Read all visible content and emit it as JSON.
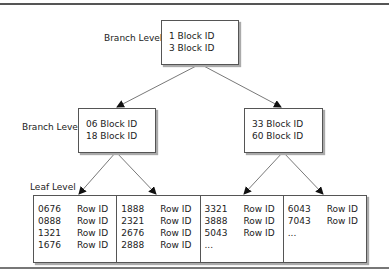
{
  "diagram": {
    "type": "b-tree-index",
    "root": {
      "level_label": "Branch Level",
      "entries": [
        "1 Block ID",
        "3 Block ID"
      ]
    },
    "branches": [
      {
        "level_label": "Branch Level",
        "entries": [
          "06 Block ID",
          "18 Block ID"
        ]
      },
      {
        "entries": [
          "33 Block ID",
          "60 Block ID"
        ]
      }
    ],
    "leaf": {
      "level_label": "Leaf Level",
      "nodes": [
        {
          "entries": [
            {
              "key": "0676",
              "value": "Row ID"
            },
            {
              "key": "0888",
              "value": "Row ID"
            },
            {
              "key": "1321",
              "value": "Row ID"
            },
            {
              "key": "1676",
              "value": "Row ID"
            }
          ]
        },
        {
          "entries": [
            {
              "key": "1888",
              "value": "Row ID"
            },
            {
              "key": "2321",
              "value": "Row ID"
            },
            {
              "key": "2676",
              "value": "Row ID"
            },
            {
              "key": "2888",
              "value": "Row ID"
            }
          ]
        },
        {
          "entries": [
            {
              "key": "3321",
              "value": "Row ID"
            },
            {
              "key": "3888",
              "value": "Row ID"
            },
            {
              "key": "5043",
              "value": "Row ID"
            },
            {
              "key": "...",
              "value": ""
            }
          ]
        },
        {
          "entries": [
            {
              "key": "6043",
              "value": "Row ID"
            },
            {
              "key": "7043",
              "value": "Row ID"
            },
            {
              "key": "...",
              "value": ""
            }
          ]
        }
      ]
    },
    "colors": {
      "border": "#555555",
      "shadow": "#aaaaaa",
      "rule": "#555555",
      "background": "#ffffff"
    }
  }
}
